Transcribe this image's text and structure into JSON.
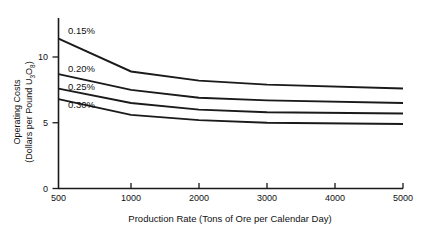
{
  "chart_data": {
    "type": "line",
    "title": "",
    "xlabel": "Production Rate (Tons of Ore per Calendar Day)",
    "ylabel_line1": "Operating Costs",
    "ylabel_line2": "(Dollars per Pound U",
    "ylabel_sub1": "3",
    "ylabel_mid": "O",
    "ylabel_sub2": "8",
    "ylabel_end": ")",
    "x_ticks": [
      500,
      1000,
      2000,
      3000,
      4000,
      5000
    ],
    "x_tick_labels": [
      "500",
      "1000",
      "2000",
      "3000",
      "4000",
      "5000"
    ],
    "y_ticks": [
      0,
      5,
      10
    ],
    "y_tick_labels": [
      "0",
      "5",
      "10"
    ],
    "xlim": [
      500,
      5000
    ],
    "ylim": [
      0,
      12.5
    ],
    "grid": false,
    "legend_position": "inline-left",
    "line_color": "#1a1a1a",
    "x": [
      500,
      1000,
      2000,
      3000,
      5000
    ],
    "series": [
      {
        "name": "0.15%",
        "label": "0.15%",
        "values": [
          11.4,
          8.9,
          8.2,
          7.9,
          7.6
        ]
      },
      {
        "name": "0.20%",
        "label": "0.20%",
        "values": [
          8.7,
          7.5,
          6.9,
          6.7,
          6.5
        ]
      },
      {
        "name": "0.25%",
        "label": "0.25%",
        "values": [
          7.6,
          6.5,
          6.0,
          5.8,
          5.7
        ]
      },
      {
        "name": "0.30%",
        "label": "0.30%",
        "values": [
          6.8,
          5.6,
          5.2,
          5.0,
          4.9
        ]
      }
    ]
  }
}
